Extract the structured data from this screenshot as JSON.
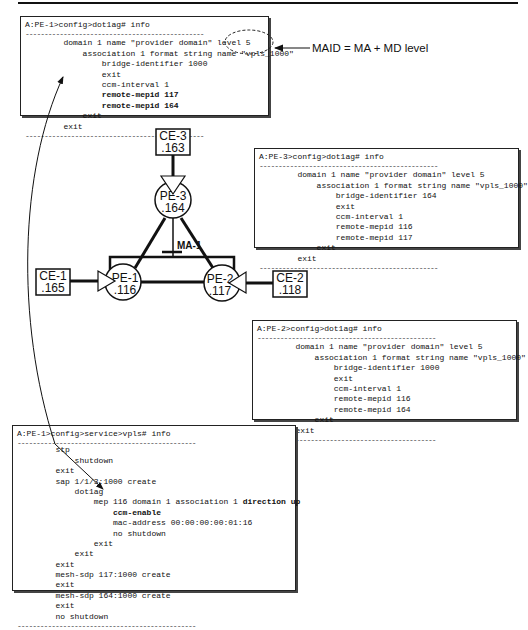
{
  "annotation": {
    "maid_label": "MAID = MA + MD level"
  },
  "ma_label": "MA-1",
  "nodes": {
    "ce3": {
      "name": "CE-3",
      "id": ".163"
    },
    "pe3": {
      "name": "PE-3",
      "id": ".164"
    },
    "ce1": {
      "name": "CE-1",
      "id": ".165"
    },
    "pe1": {
      "name": "PE-1",
      "id": ".116"
    },
    "pe2": {
      "name": "PE-2",
      "id": ".117"
    },
    "ce2": {
      "name": "CE-2",
      "id": ".118"
    }
  },
  "pe1_dot1ag": {
    "prompt": "A:PE-1>config>dot1ag# info",
    "dashes": "-----------------------------------------------",
    "lines": [
      "        domain 1 name \"provider domain\" level 5",
      "            association 1 format string name \"vpls_1000\"",
      "                bridge-identifier 1000",
      "                exit",
      "                ccm-interval 1",
      "                remote-mepid 117",
      "                remote-mepid 164",
      "            exit",
      "        exit"
    ]
  },
  "pe3_dot1ag": {
    "prompt": "A:PE-3>config>dot1ag# info",
    "dashes": "-----------------------------------------------",
    "lines": [
      "        domain 1 name \"provider domain\" level 5",
      "            association 1 format string name \"vpls_1000\"",
      "                bridge-identifier 164",
      "                exit",
      "                ccm-interval 1",
      "                remote-mepid 116",
      "                remote-mepid 117",
      "            exit",
      "        exit"
    ]
  },
  "pe2_dot1ag": {
    "prompt": "A:PE-2>config>dot1ag# info",
    "dashes": "-----------------------------------------------",
    "lines": [
      "        domain 1 name \"provider domain\" level 5",
      "            association 1 format string name \"vpls_1000\"",
      "                bridge-identifier 1000",
      "                exit",
      "                ccm-interval 1",
      "                remote-mepid 116",
      "                remote-mepid 164",
      "            exit",
      "        exit"
    ]
  },
  "pe1_vpls": {
    "prompt": "A:PE-1>config>service>vpls# info",
    "dashes": "-----------------------------------------------",
    "lines": [
      "        stp",
      "            shutdown",
      "        exit",
      "        sap 1/1/3:1000 create",
      "            dot1ag",
      "                mep 116 domain 1 association 1 ",
      "                    ccm-enable",
      "                    mac-address 00:00:00:00:01:16",
      "                    no shutdown",
      "                exit",
      "            exit",
      "        exit",
      "        mesh-sdp 117:1000 create",
      "        exit",
      "        mesh-sdp 164:1000 create",
      "        exit",
      "        no shutdown"
    ],
    "mep_bold_suffix": "direction up"
  }
}
